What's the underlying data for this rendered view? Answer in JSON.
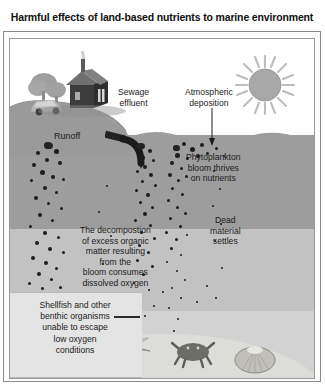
{
  "figure": {
    "title": "Harmful effects of land-based nutrients to marine environment"
  },
  "labels": {
    "sewage_effluent": "Sewage\neffluent",
    "sewage_line1": "Sewage",
    "sewage_line2": "effluent",
    "atmospheric_line1": "Atmospheric",
    "atmospheric_line2": "deposition",
    "runoff": "Runoff",
    "phyto_line1": "Phytoplankton",
    "phyto_line2": "bloom thrives",
    "phyto_line3": "on nutrients",
    "dead_line1": "Dead",
    "dead_line2": "material",
    "dead_line3": "settles",
    "decomp_line1": "The decompostion",
    "decomp_line2": "of excess organic",
    "decomp_line3": "matter resulting",
    "decomp_line4": "from the",
    "decomp_line5": "bloom consumes",
    "decomp_line6": "dissolved oxygen",
    "shellfish_line1": "Shellfish and other",
    "shellfish_line2": "benthic organisms",
    "shellfish_line3": "unable to escape",
    "shellfish_line4": "low oxygen",
    "shellfish_line5": "conditions"
  },
  "icons": {
    "sun": "sun-icon",
    "house": "house-icon",
    "tree": "tree-icon",
    "car": "car-icon",
    "smoke": "smoke-icon",
    "pipe": "outfall-pipe-icon",
    "starfish": "starfish-icon",
    "crab": "crab-icon",
    "clam": "clam-shell-icon",
    "arrow": "down-arrow-icon"
  },
  "colors": {
    "sky": "#ffffff",
    "water_surface_layer": "#9d9d9d",
    "water_mid_layer": "#c2c2c2",
    "water_deep_layer": "#d2d2d2",
    "seabed": "#dcdcd8",
    "land": "#9a9a9a",
    "particles": "#1d1d1d",
    "callout_box": "#e4e4e4",
    "frame": "#8a8a8a",
    "text": "#1b1b1b"
  }
}
